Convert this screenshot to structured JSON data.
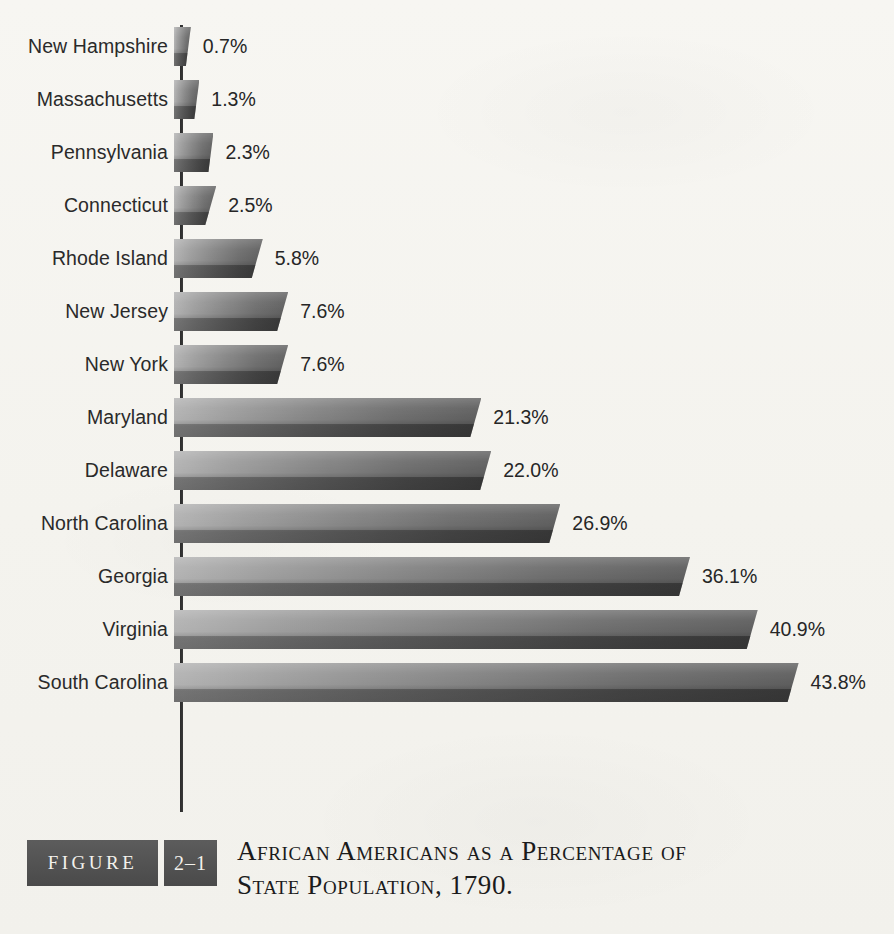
{
  "chart_data": {
    "type": "bar",
    "orientation": "horizontal",
    "title": "African Americans as a Percentage of State Population, 1790.",
    "xlabel": "",
    "ylabel": "",
    "xlim": [
      0,
      45
    ],
    "grid": false,
    "legend": null,
    "value_suffix": "%",
    "categories": [
      "New Hampshire",
      "Massachusetts",
      "Pennsylvania",
      "Connecticut",
      "Rhode Island",
      "New Jersey",
      "New York",
      "Maryland",
      "Delaware",
      "North Carolina",
      "Georgia",
      "Virginia",
      "South Carolina"
    ],
    "values": [
      0.7,
      1.3,
      2.3,
      2.5,
      5.8,
      7.6,
      7.6,
      21.3,
      22.0,
      26.9,
      36.1,
      40.9,
      43.8
    ],
    "value_labels": [
      "0.7%",
      "1.3%",
      "2.3%",
      "2.5%",
      "5.8%",
      "7.6%",
      "7.6%",
      "21.3%",
      "22.0%",
      "26.9%",
      "36.1%",
      "40.9%",
      "43.8%"
    ],
    "bars": [
      {
        "label": "New Hampshire",
        "value": 0.7,
        "value_label": "0.7%"
      },
      {
        "label": "Massachusetts",
        "value": 1.3,
        "value_label": "1.3%"
      },
      {
        "label": "Pennsylvania",
        "value": 2.3,
        "value_label": "2.3%"
      },
      {
        "label": "Connecticut",
        "value": 2.5,
        "value_label": "2.5%"
      },
      {
        "label": "Rhode Island",
        "value": 5.8,
        "value_label": "5.8%"
      },
      {
        "label": "New Jersey",
        "value": 7.6,
        "value_label": "7.6%"
      },
      {
        "label": "New York",
        "value": 7.6,
        "value_label": "7.6%"
      },
      {
        "label": "Maryland",
        "value": 21.3,
        "value_label": "21.3%"
      },
      {
        "label": "Delaware",
        "value": 22.0,
        "value_label": "22.0%"
      },
      {
        "label": "North Carolina",
        "value": 26.9,
        "value_label": "26.9%"
      },
      {
        "label": "Georgia",
        "value": 36.1,
        "value_label": "36.1%"
      },
      {
        "label": "Virginia",
        "value": 40.9,
        "value_label": "40.9%"
      },
      {
        "label": "South Carolina",
        "value": 43.8,
        "value_label": "43.8%"
      }
    ],
    "colors": {
      "background": "#f6f5f1",
      "axis": "#2b2b2b",
      "bar_light": "#b2b2b2",
      "bar_dark": "#5d5d5d",
      "text": "#262626",
      "caption_badge": "#4f4f4f",
      "caption_badge_text": "#f3f1ec"
    }
  },
  "caption": {
    "figure_word": "FIGURE",
    "figure_number": "2–1",
    "title_line_1": "African Americans as a Percentage of",
    "title_line_2": "State Population, 1790."
  },
  "layout": {
    "axis_x_px": 181,
    "px_per_percent": 14.1,
    "row_pitch_px": 53,
    "bar_height_px": 39,
    "first_row_top_px": 46
  }
}
